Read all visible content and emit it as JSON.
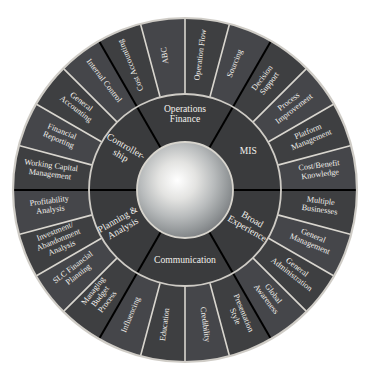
{
  "diagram": {
    "type": "concentric-segmented-wheel",
    "colors": {
      "segment_fill": "#3e3f41",
      "segment_fill_alt": "#45464a",
      "inner_fill": "#3a3b3d",
      "label_text": "#f2f0ec",
      "minor_divider": "#d9d6cf",
      "major_divider": "#000000",
      "rim": "#cfccc6",
      "background": "#ffffff",
      "hub_center": "#ffffff",
      "hub_edge": "#7e8184"
    },
    "geometry": {
      "center_x": 185,
      "center_y": 190,
      "hub_radius": 48,
      "inner_ring_outer_radius": 96,
      "outer_ring_outer_radius": 172
    },
    "hub": {
      "label": ""
    },
    "sectors": [
      {
        "id": "operations-finance",
        "label": "Operations\nFinance",
        "label_line1": "Operations",
        "label_line2": "Finance",
        "start_deg": -120,
        "end_deg": -60,
        "orientation": "horizontal",
        "segments": [
          {
            "label": "Cost Accounting",
            "label_line1": "Cost Accounting",
            "label_line2": ""
          },
          {
            "label": "ABC",
            "label_line1": "ABC",
            "label_line2": ""
          },
          {
            "label": "Operation Flow",
            "label_line1": "Operation Flow",
            "label_line2": ""
          },
          {
            "label": "Sourcing",
            "label_line1": "Sourcing",
            "label_line2": ""
          }
        ]
      },
      {
        "id": "mis",
        "label": "MIS",
        "label_line1": "MIS",
        "label_line2": "",
        "start_deg": -60,
        "end_deg": 0,
        "orientation": "horizontal",
        "segments": [
          {
            "label": "Decision Support",
            "label_line1": "Decision",
            "label_line2": "Support"
          },
          {
            "label": "Process Improvement",
            "label_line1": "Process",
            "label_line2": "Improvement"
          },
          {
            "label": "Platform Management",
            "label_line1": "Platform",
            "label_line2": "Management"
          },
          {
            "label": "Cost/Benefit Knowledge",
            "label_line1": "Cost/Benefit",
            "label_line2": "Knowledge"
          }
        ]
      },
      {
        "id": "broad-experience",
        "label": "Broad Experience",
        "label_line1": "Broad",
        "label_line2": "Experience",
        "start_deg": 0,
        "end_deg": 60,
        "orientation": "radial",
        "segments": [
          {
            "label": "Multiple Businesses",
            "label_line1": "Multiple",
            "label_line2": "Businesses"
          },
          {
            "label": "General Management",
            "label_line1": "General",
            "label_line2": "Management"
          },
          {
            "label": "General Administration",
            "label_line1": "General",
            "label_line2": "Administration"
          },
          {
            "label": "Global Awareness",
            "label_line1": "Global",
            "label_line2": "Awareness"
          }
        ]
      },
      {
        "id": "communication",
        "label": "Communication",
        "label_line1": "Communication",
        "label_line2": "",
        "start_deg": 60,
        "end_deg": 120,
        "orientation": "horizontal",
        "segments": [
          {
            "label": "Presentation Style",
            "label_line1": "Presentation",
            "label_line2": "Style"
          },
          {
            "label": "Credibility",
            "label_line1": "Credibility",
            "label_line2": ""
          },
          {
            "label": "Education",
            "label_line1": "Education",
            "label_line2": ""
          },
          {
            "label": "Influencing",
            "label_line1": "Influencing",
            "label_line2": ""
          }
        ]
      },
      {
        "id": "planning-analysis",
        "label": "Planning & Analysis",
        "label_line1": "Planning &",
        "label_line2": "Analysis",
        "start_deg": 120,
        "end_deg": 180,
        "orientation": "radial",
        "segments": [
          {
            "label": "Managing Budget Process",
            "label_line1": "Managing",
            "label_line2": "Budget",
            "label_line3": "Process"
          },
          {
            "label": "SLC Financial Planning",
            "label_line1": "SLC Financial",
            "label_line2": "Planning"
          },
          {
            "label": "Investment/Abandonment Analysis",
            "label_line1": "Investment/",
            "label_line2": "Abandonment",
            "label_line3": "Analysis"
          },
          {
            "label": "Profitability Analysis",
            "label_line1": "Profitability",
            "label_line2": "Analysis"
          }
        ]
      },
      {
        "id": "controllership",
        "label": "Controller-ship",
        "label_line1": "Controller-",
        "label_line2": "ship",
        "start_deg": 180,
        "end_deg": 240,
        "orientation": "radial",
        "segments": [
          {
            "label": "Working Capital Management",
            "label_line1": "Working Capital",
            "label_line2": "Management"
          },
          {
            "label": "Financial Reporting",
            "label_line1": "Financial",
            "label_line2": "Reporting"
          },
          {
            "label": "General Accounting",
            "label_line1": "General",
            "label_line2": "Accounting"
          },
          {
            "label": "Internal Control",
            "label_line1": "Internal Control",
            "label_line2": ""
          }
        ]
      }
    ],
    "outer_segment_labels_clockwise_from_top_left": [
      "Cost Accounting",
      "ABC",
      "Operation Flow",
      "Sourcing",
      "Decision Support",
      "Process Improvement",
      "Platform Management",
      "Cost/Benefit Knowledge",
      "Multiple Businesses",
      "General Management",
      "General Administration",
      "Global Awareness",
      "Presentation Style",
      "Credibility",
      "Education",
      "Influencing",
      "Managing Budget Process",
      "SLC Financial Planning",
      "Investment/Abandonment Analysis",
      "Profitability Analysis",
      "Working Capital Management",
      "Financial Reporting",
      "General Accounting",
      "Internal Control"
    ],
    "inner_sector_labels_clockwise_from_top": [
      "Operations Finance",
      "MIS",
      "Broad Experience",
      "Communication",
      "Planning & Analysis",
      "Controller-ship"
    ]
  }
}
